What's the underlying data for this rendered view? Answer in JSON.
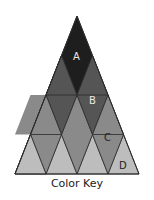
{
  "caption": "Color Key",
  "labels": {
    "A": "A",
    "B": "B",
    "C": "C",
    "D": "D"
  },
  "colors": {
    "A": "#1e1e1e",
    "B": "#555555",
    "C": "#8a8a8a",
    "D": "#bdbdbd",
    "stroke": "#2a2a2a"
  }
}
